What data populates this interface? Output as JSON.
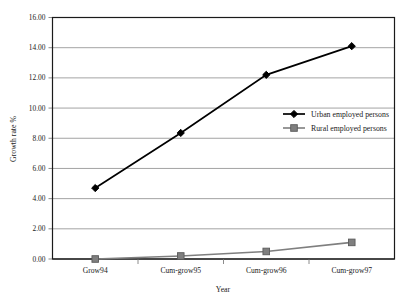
{
  "chart_data": {
    "type": "line",
    "title": "",
    "xlabel": "Year",
    "ylabel": "Growth rate %",
    "categories": [
      "Grow94",
      "Cum-grow95",
      "Cum-grow96",
      "Cum-grow97"
    ],
    "series": [
      {
        "name": "Urban employed persons",
        "values": [
          4.7,
          8.35,
          12.2,
          14.1
        ],
        "color": "#000000",
        "marker": "diamond"
      },
      {
        "name": "Rural employed persons",
        "values": [
          0.0,
          0.2,
          0.5,
          1.1
        ],
        "color": "#7f7f7f",
        "marker": "square"
      }
    ],
    "ylim": [
      0,
      16
    ],
    "ytick_step": 2,
    "ytick_labels": [
      "0.00",
      "2.00",
      "4.00",
      "6.00",
      "8.00",
      "10.00",
      "12.00",
      "14.00",
      "16.00"
    ],
    "grid": true,
    "legend_position": "inside-right"
  },
  "axes": {
    "y_title": "Growth rate %",
    "x_title": "Year"
  },
  "legend": {
    "entries": [
      {
        "label": "Urban employed persons"
      },
      {
        "label": "Rural employed persons"
      }
    ]
  },
  "colors": {
    "urban": "#000000",
    "rural": "#7f7f7f",
    "grid": "#8c8c8c",
    "frame": "#1a1a1a",
    "background": "#ffffff"
  }
}
